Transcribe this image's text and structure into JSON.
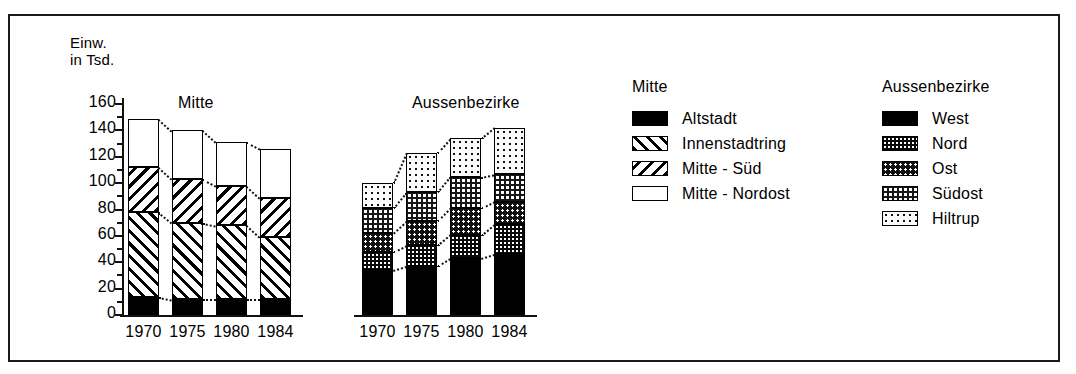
{
  "figure": {
    "axis_title": "Einw.\nin Tsd.",
    "y_ticks": [
      "160",
      "140",
      "120",
      "100",
      "80",
      "60",
      "40",
      "20",
      "0"
    ],
    "panels": [
      {
        "name": "mitte",
        "title": "Mitte",
        "x_labels": [
          "1970",
          "1975",
          "1980",
          "1984"
        ]
      },
      {
        "name": "aussenbezirke",
        "title": "Aussenbezirke",
        "x_labels": [
          "1970",
          "1975",
          "1980",
          "1984"
        ]
      }
    ]
  },
  "legends": [
    {
      "name": "mitte",
      "heading": "Mitte",
      "items": [
        {
          "label": "Altstadt",
          "pattern": "solid-black"
        },
        {
          "label": "Innenstadtring",
          "pattern": "forward-hatch"
        },
        {
          "label": "Mitte - Süd",
          "pattern": "backward-hatch"
        },
        {
          "label": "Mitte - Nordost",
          "pattern": "empty-white"
        }
      ]
    },
    {
      "name": "aussenbezirke",
      "heading": "Aussenbezirke",
      "items": [
        {
          "label": "West",
          "pattern": "solid-black"
        },
        {
          "label": "Nord",
          "pattern": "dense-dark-dots"
        },
        {
          "label": "Ost",
          "pattern": "medium-dark-dots"
        },
        {
          "label": "Südost",
          "pattern": "checkered-dots"
        },
        {
          "label": "Hiltrup",
          "pattern": "light-dots"
        }
      ]
    }
  ],
  "chart_data": {
    "type": "bar",
    "title": "",
    "subtitle": "",
    "xlabel": "",
    "ylabel": "Einw. in Tsd.",
    "ylim": [
      0,
      160
    ],
    "ytick_step": 20,
    "grid": false,
    "stacked": true,
    "connectors": true,
    "legend_position": "right",
    "units": "Tausend Einwohner",
    "panels": [
      {
        "name": "Mitte",
        "categories": [
          "1970",
          "1975",
          "1980",
          "1984"
        ],
        "series": [
          {
            "name": "Altstadt",
            "values": [
              14,
              12,
              12,
              12
            ]
          },
          {
            "name": "Innenstadtring",
            "values": [
              64,
              58,
              56,
              47
            ]
          },
          {
            "name": "Mitte - Süd",
            "values": [
              34,
              33,
              30,
              30
            ]
          },
          {
            "name": "Mitte - Nordost",
            "values": [
              37,
              37,
              33,
              37
            ]
          }
        ],
        "totals": [
          149,
          140,
          131,
          126
        ]
      },
      {
        "name": "Aussenbezirke",
        "categories": [
          "1970",
          "1975",
          "1980",
          "1984"
        ],
        "series": [
          {
            "name": "West",
            "values": [
              34,
              37,
              43,
              46
            ]
          },
          {
            "name": "Nord",
            "values": [
              14,
              16,
              18,
              23
            ]
          },
          {
            "name": "Ost",
            "values": [
              14,
              18,
              20,
              17
            ]
          },
          {
            "name": "Südost",
            "values": [
              19,
              22,
              24,
              21
            ]
          },
          {
            "name": "Hiltrup",
            "values": [
              19,
              30,
              29,
              35
            ]
          }
        ],
        "totals": [
          100,
          123,
          134,
          142
        ]
      }
    ]
  }
}
